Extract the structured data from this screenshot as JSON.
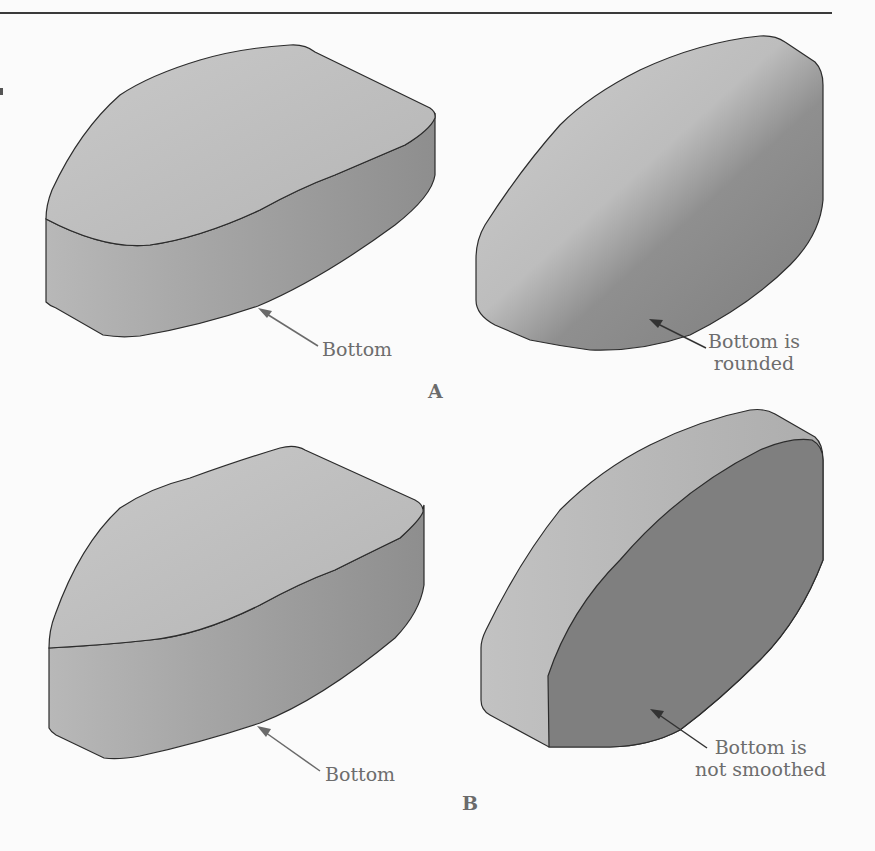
{
  "figure": {
    "panels": [
      {
        "label": "A",
        "left_shape": {
          "callout": "Bottom"
        },
        "right_shape": {
          "callout_line1": "Bottom is",
          "callout_line2": "rounded"
        }
      },
      {
        "label": "B",
        "left_shape": {
          "callout": "Bottom"
        },
        "right_shape": {
          "callout_line1": "Bottom is",
          "callout_line2": "not smoothed"
        }
      }
    ]
  },
  "colors": {
    "page_bg": "#fbfbfb",
    "shape_light": "#c4c4c4",
    "shape_mid": "#a9a9a9",
    "shape_dark": "#808080",
    "outline": "#2c2c2c",
    "callout_text": "#6d6d6d"
  }
}
